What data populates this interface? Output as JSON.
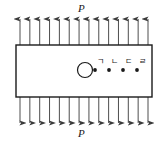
{
  "figure": {
    "type": "mechanics-diagram",
    "width": 162,
    "height": 143,
    "background_color": "#ffffff",
    "stroke_color": "#1a1a1a",
    "arrow_color": "#3a3a3a"
  },
  "loads": {
    "top_label": "P",
    "bottom_label": "P",
    "top_direction": "up",
    "bottom_direction": "down",
    "top_arrow_count": 14,
    "bottom_arrow_count": 14,
    "arrow_x_start": 20,
    "arrow_x_end": 148,
    "top_arrow_tip_y": 19,
    "top_arrow_tail_y": 45,
    "bottom_arrow_tail_y": 97,
    "bottom_arrow_tip_y": 123
  },
  "plate": {
    "x": 16,
    "y": 45,
    "width": 136,
    "height": 52,
    "fill": "#ffffff",
    "stroke_width": 1.4
  },
  "hole": {
    "center_x": 85,
    "center_y": 70,
    "radius": 7.5,
    "stroke_width": 1.2
  },
  "points": [
    {
      "label": "ㄱ",
      "x": 95,
      "y": 70,
      "label_x": 97,
      "label_y": 58
    },
    {
      "label": "ㄴ",
      "x": 109,
      "y": 70,
      "label_x": 111,
      "label_y": 58
    },
    {
      "label": "ㄷ",
      "x": 123,
      "y": 70,
      "label_x": 125,
      "label_y": 58
    },
    {
      "label": "ㄹ",
      "x": 137,
      "y": 70,
      "label_x": 139,
      "label_y": 58
    }
  ],
  "point_dot_radius": 1.9
}
